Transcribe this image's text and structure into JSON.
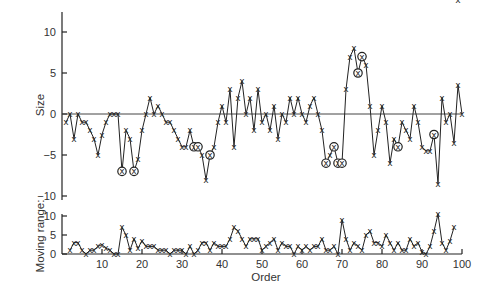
{
  "chart_data": [
    {
      "type": "line",
      "panel": "individuals",
      "title": "",
      "xlabel": "",
      "ylabel": "Size",
      "ylim": [
        -10,
        12
      ],
      "yticks": [
        10,
        5,
        0,
        -5,
        -10
      ],
      "ytick_labels": [
        "10",
        "5",
        "0",
        "−5",
        "−10"
      ],
      "center_line": 0,
      "marker": "x",
      "x": [
        1,
        2,
        3,
        4,
        5,
        6,
        7,
        8,
        9,
        10,
        11,
        12,
        13,
        14,
        15,
        16,
        17,
        18,
        19,
        20,
        21,
        22,
        23,
        24,
        25,
        26,
        27,
        28,
        29,
        30,
        31,
        32,
        33,
        34,
        35,
        36,
        37,
        38,
        39,
        40,
        41,
        42,
        43,
        44,
        45,
        46,
        47,
        48,
        49,
        50,
        51,
        52,
        53,
        54,
        55,
        56,
        57,
        58,
        59,
        60,
        61,
        62,
        63,
        64,
        65,
        66,
        67,
        68,
        69,
        70,
        71,
        72,
        73,
        74,
        75,
        76,
        77,
        78,
        79,
        80,
        81,
        82,
        83,
        84,
        85,
        86,
        87,
        88,
        89,
        90,
        91,
        92,
        93,
        94,
        95,
        96,
        97,
        98,
        99,
        100
      ],
      "values": [
        -1,
        0,
        -3,
        0,
        -1,
        -1,
        -2,
        -3,
        -5,
        -2.5,
        -1,
        0,
        0,
        0,
        -7,
        -2,
        -3,
        -7,
        -5.5,
        -2,
        0,
        2,
        0,
        1,
        0,
        -1,
        -1,
        -2,
        -3,
        -4,
        -4,
        -2,
        -4,
        -4,
        -5,
        -8,
        -5,
        -4,
        -1,
        1,
        -1,
        3,
        -4,
        2,
        4,
        0,
        2,
        -2,
        3,
        -1,
        0,
        -2,
        1,
        -3,
        0,
        -1,
        2,
        0,
        2,
        0,
        -1,
        1,
        2,
        0,
        -2,
        -6,
        -5,
        -4,
        -6,
        -6,
        3,
        7,
        8,
        5,
        7,
        6,
        1,
        -5,
        -2,
        1,
        -1,
        -6,
        -3,
        -4,
        -1,
        -2,
        -3,
        1,
        -1,
        -4,
        -4.5,
        -4.5,
        -2.5,
        -8.5,
        2,
        -1,
        0,
        -3.5,
        3.5,
        0
      ],
      "circled": [
        15,
        18,
        33,
        34,
        37,
        66,
        68,
        69,
        70,
        74,
        75,
        84,
        93
      ]
    },
    {
      "type": "line",
      "panel": "moving-range",
      "ylabel": "Moving range:",
      "xlabel": "Order",
      "ylim": [
        0,
        10
      ],
      "yticks": [
        10,
        5,
        0
      ],
      "ytick_labels": [
        "10",
        "5",
        "0"
      ],
      "xlim": [
        0,
        100
      ],
      "xticks": [
        10,
        20,
        30,
        40,
        50,
        60,
        70,
        80,
        90,
        100
      ],
      "xtick_labels": [
        "10",
        "20",
        "30",
        "40",
        "50",
        "60",
        "70",
        "80",
        "90",
        "100"
      ],
      "marker": "x",
      "x": [
        2,
        3,
        4,
        5,
        6,
        7,
        8,
        9,
        10,
        11,
        12,
        13,
        14,
        15,
        16,
        17,
        18,
        19,
        20,
        21,
        22,
        23,
        24,
        25,
        26,
        27,
        28,
        29,
        30,
        31,
        32,
        33,
        34,
        35,
        36,
        37,
        38,
        39,
        40,
        41,
        42,
        43,
        44,
        45,
        46,
        47,
        48,
        49,
        50,
        51,
        52,
        53,
        54,
        55,
        56,
        57,
        58,
        59,
        60,
        61,
        62,
        63,
        64,
        65,
        66,
        67,
        68,
        69,
        70,
        71,
        72,
        73,
        74,
        75,
        76,
        77,
        78,
        79,
        80,
        81,
        82,
        83,
        84,
        85,
        86,
        87,
        88,
        89,
        90,
        91,
        92,
        93,
        94,
        95,
        96,
        97,
        98,
        99
      ],
      "values": [
        1,
        3,
        3,
        1,
        0,
        1,
        1,
        2,
        2.5,
        1.5,
        1,
        0,
        0,
        7,
        5,
        1,
        4,
        1.5,
        3.5,
        2,
        2,
        2,
        1,
        1,
        1,
        0,
        1,
        1,
        1,
        0,
        2,
        0,
        1,
        3,
        3,
        1,
        3,
        2,
        2,
        2,
        4,
        7,
        6,
        4,
        2,
        4,
        4,
        4,
        1,
        2,
        3,
        4,
        1,
        3,
        2,
        2,
        0,
        2,
        1,
        2,
        1,
        2,
        2,
        4,
        1,
        1,
        2,
        0,
        9,
        4,
        1,
        3,
        2,
        1,
        5,
        6,
        3,
        3,
        2,
        5,
        3,
        1,
        3,
        1,
        1,
        4,
        2,
        3,
        0.5,
        0,
        2,
        6,
        10.5,
        3,
        1,
        3.5,
        7
      ]
    }
  ]
}
